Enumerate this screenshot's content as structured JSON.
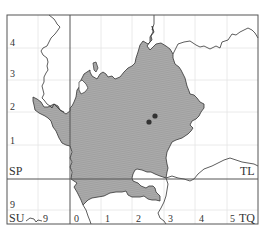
{
  "map": {
    "colors": {
      "frame": "#555555",
      "major_grid": "#555555",
      "minor_grid": "#e2e2e2",
      "region_fill": "#a9a9a9",
      "region_hatch": "#8f8f8f",
      "region_stroke": "#333333",
      "boundary": "#333333",
      "record_dot": "#333333",
      "label": "#333333"
    },
    "grid_squares": {
      "top_left": "SP",
      "top_right": "TL",
      "bottom_left": "SU",
      "bottom_right": "TQ"
    },
    "left_ticks": [
      "4",
      "3",
      "2",
      "1",
      "9"
    ],
    "bottom_ticks": [
      "9",
      "0",
      "1",
      "2",
      "3",
      "4",
      "5"
    ],
    "records": [
      {
        "x": 148,
        "y": 121
      },
      {
        "x": 154,
        "y": 116
      }
    ]
  }
}
